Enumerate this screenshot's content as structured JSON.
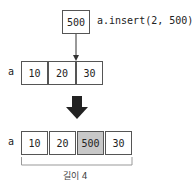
{
  "top": {
    "value": "500",
    "code": "a.insert(2, 500)"
  },
  "before": {
    "var": "a",
    "cells": [
      "10",
      "20",
      "30"
    ]
  },
  "after": {
    "var": "a",
    "cells": [
      "10",
      "20",
      "500",
      "30"
    ],
    "highlight_index": 2,
    "caption": "길이 4"
  },
  "colors": {
    "highlight": "#c8c8c8",
    "border": "#555555",
    "arrow": "#222222"
  }
}
